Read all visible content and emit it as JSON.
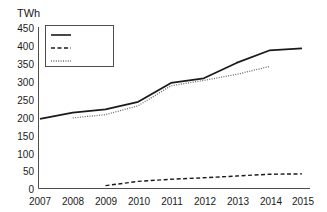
{
  "chart_data": {
    "type": "line",
    "title": "",
    "ylabel": "TWh",
    "xlabel": "",
    "categories": [
      "2007",
      "2008",
      "2009",
      "2010",
      "2011",
      "2012",
      "2013",
      "2014",
      "2015"
    ],
    "x": [
      2007,
      2008,
      2009,
      2010,
      2011,
      2012,
      2013,
      2014,
      2015
    ],
    "ylim": [
      0,
      450
    ],
    "yticks": [
      0,
      50,
      100,
      150,
      200,
      250,
      300,
      350,
      400,
      450
    ],
    "grid": false,
    "legend_position": "upper-left-inside",
    "series": [
      {
        "name": "Total",
        "style": "solid",
        "color": "#1a1a1a",
        "values": [
          195,
          213,
          222,
          243,
          296,
          309,
          352,
          387,
          393
        ]
      },
      {
        "name": "Wind",
        "style": "dashed",
        "color": "#1a1a1a",
        "values": [
          null,
          null,
          8,
          20,
          26,
          30,
          35,
          40,
          41
        ]
      },
      {
        "name": "Thermal",
        "style": "dotted",
        "color": "#6a6a6a",
        "values": [
          null,
          198,
          207,
          232,
          288,
          303,
          320,
          342,
          null
        ]
      }
    ]
  },
  "axis": {
    "unit_label": "TWh",
    "ytick_labels": [
      "450",
      "400",
      "350",
      "300",
      "250",
      "200",
      "150",
      "100",
      "50",
      "0"
    ],
    "xtick_labels": [
      "2007",
      "2008",
      "2009",
      "2010",
      "2011",
      "2012",
      "2013",
      "2014",
      "2015"
    ]
  },
  "legend": {
    "items": [
      {
        "label": "Total",
        "style": "solid"
      },
      {
        "label": "Wind",
        "style": "dashed"
      },
      {
        "label": "Thermal",
        "style": "dotted"
      }
    ]
  },
  "colors": {
    "background": "#ffffff",
    "axis": "#4d4d4d",
    "total": "#1a1a1a",
    "wind": "#1a1a1a",
    "thermal": "#6a6a6a",
    "text": "#1a1a1a"
  }
}
